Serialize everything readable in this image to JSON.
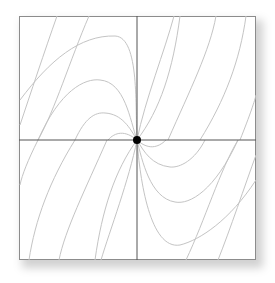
{
  "diagram": {
    "type": "phase-portrait",
    "frame": {
      "x": 19,
      "y": 16,
      "width": 237,
      "height": 244
    },
    "origin": {
      "x": 137,
      "y": 140
    },
    "colors": {
      "frame": "#8c8c8c",
      "axes": "#555555",
      "trajectory": "#c4c4c4",
      "equilibrium": "#000000"
    },
    "equilibrium_point": {
      "label": "",
      "radius": 4
    },
    "trajectories": [
      "M 20 100 C 50 60, 80 35, 115 36 C 140 37, 135 110, 137 140",
      "M 38 140 C 60 90, 85 78, 100 80 C 125 82, 130 120, 137 140",
      "M 75 140 C 85 118, 95 112, 105 113 C 122 114, 130 128, 137 140",
      "M 108 140 C 115 132, 125 130, 137 140",
      "M 57 16 C 45 50, 30 95, 20 125",
      "M 89 16 C 70 60, 55 110, 38 140",
      "M 137 140 C 145 100, 165 50, 174 16",
      "M 137 140 C 160 110, 173 70, 180 16",
      "M 168 140 C 190 90, 210 50, 216 16",
      "M 200 140 C 225 100, 240 60, 246 16",
      "M 240 140 C 250 115, 255 100, 256 95",
      "M 256 180 C 230 220, 200 240, 180 245 C 150 250, 140 180, 137 140",
      "M 238 140 C 215 190, 190 205, 175 202 C 150 198, 142 160, 137 140",
      "M 205 140 C 195 160, 180 168, 170 167 C 152 165, 144 152, 137 140",
      "M 166 140 C 158 148, 148 150, 137 140",
      "M 218 260 C 230 230, 245 185, 256 155",
      "M 186 260 C 205 220, 220 170, 238 140",
      "M 137 140 C 129 180, 110 230, 101 260",
      "M 137 140 C 115 170, 102 210, 95 260",
      "M 107 140 C 85 190, 65 230, 59 260",
      "M 75 140 C 50 180, 35 220, 29 260",
      "M 38 140 C 28 160, 22 175, 20 185"
    ]
  }
}
